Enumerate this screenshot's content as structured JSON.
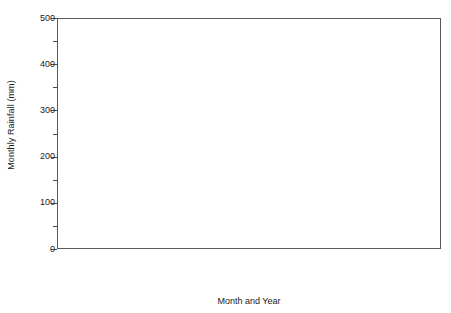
{
  "chart_data": {
    "type": "bar",
    "title": "",
    "xlabel": "Month and Year",
    "ylabel": "Monthly Rainfall (mm)",
    "ylim": [
      0,
      500
    ],
    "y_ticks_major": [
      0,
      100,
      200,
      300,
      400,
      500
    ],
    "y_ticks_minor": [
      50,
      150,
      250,
      350,
      450
    ],
    "grid": false,
    "legend": "none",
    "bar_fill": "diagonal-hatch",
    "bar_edge_color": "#6b6b6b",
    "categories": [
      "Apr '94",
      "May '94",
      "Jun '94",
      "Jul '94",
      "Aug '94",
      "Sep '94",
      "Oct '94",
      "Nov '94",
      "Dec '94",
      "Jan '95",
      "Feb '95",
      "Mar '95",
      "Apr '95",
      "May '95",
      "Jun '95",
      "May '99",
      "Jun '99",
      "Jul '99",
      "Aug '99",
      "Sept '99",
      "Oct '99",
      "Aug '03",
      "Sep '03",
      "Oct '03",
      "Nov '03",
      "Dec '03",
      "Jan '04",
      "Feb '04",
      "Mar '04",
      "Apr '04",
      "May '04"
    ],
    "values": [
      108,
      113,
      92,
      3,
      12,
      2,
      52,
      293,
      285,
      322,
      412,
      475,
      200,
      275,
      22,
      135,
      12,
      8,
      30,
      45,
      70,
      48,
      78,
      80,
      197,
      465,
      448,
      205,
      228,
      243,
      30
    ],
    "groups": [
      {
        "name": "1994-1995",
        "start_index": 0,
        "count": 15
      },
      {
        "name": "1999",
        "start_index": 15,
        "count": 6
      },
      {
        "name": "2003-2004",
        "start_index": 21,
        "count": 10
      }
    ]
  }
}
